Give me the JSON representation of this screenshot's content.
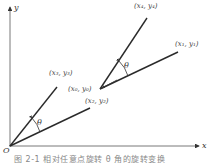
{
  "figure": {
    "axes": {
      "x_label": "x",
      "y_label": "y",
      "origin_label": "O"
    },
    "points": {
      "p0": "(x₀, y₀)",
      "p1": "(x₁, y₁)",
      "p2": "(x₂, y₂)",
      "p3": "(x₃, y₃)",
      "p4": "(x₄, y₄)"
    },
    "angles": {
      "theta_origin": "θ",
      "theta_p0": "θ"
    },
    "caption": "图 2-1  相对任意点旋转 θ 角的旋转变换"
  },
  "colors": {
    "line": "#2a2a2a",
    "axis": "#555555",
    "text": "#444444"
  }
}
